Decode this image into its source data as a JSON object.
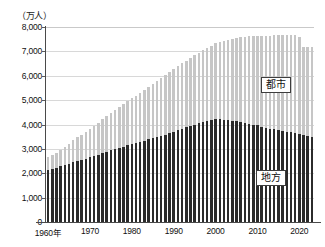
{
  "chart_data": {
    "type": "bar",
    "subtype": "stacked-bar",
    "title": "",
    "xlabel": "",
    "ylabel": "（万人）",
    "unit_label": "（万人）",
    "ylim": [
      0,
      8000
    ],
    "ytick_values": [
      8000,
      7000,
      6000,
      5000,
      4000,
      3000,
      2000,
      1000,
      0
    ],
    "ytick_labels": [
      "8,000",
      "7,000",
      "6,000",
      "5,000",
      "4,000",
      "3,000",
      "2,000",
      "1,000",
      "0"
    ],
    "grid": true,
    "grid_axis": "y",
    "legend_position": "inline-callout",
    "x_start": 1960,
    "x_end": 2023,
    "xtick_values": [
      1960,
      1970,
      1980,
      1990,
      2000,
      2010,
      2020
    ],
    "xtick_labels": [
      "1960年",
      "1970",
      "1980",
      "1990",
      "2000",
      "2010",
      "2020"
    ],
    "x": [
      1960,
      1961,
      1962,
      1963,
      1964,
      1965,
      1966,
      1967,
      1968,
      1969,
      1970,
      1971,
      1972,
      1973,
      1974,
      1975,
      1976,
      1977,
      1978,
      1979,
      1980,
      1981,
      1982,
      1983,
      1984,
      1985,
      1986,
      1987,
      1988,
      1989,
      1990,
      1991,
      1992,
      1993,
      1994,
      1995,
      1996,
      1997,
      1998,
      1999,
      2000,
      2001,
      2002,
      2003,
      2004,
      2005,
      2006,
      2007,
      2008,
      2009,
      2010,
      2011,
      2012,
      2013,
      2014,
      2015,
      2016,
      2017,
      2018,
      2019,
      2020,
      2021,
      2022,
      2023
    ],
    "series": [
      {
        "name": "地方",
        "label": "地方",
        "color": "#2b2b2b",
        "stack_order": 0,
        "values": [
          2150,
          2190,
          2230,
          2280,
          2330,
          2390,
          2450,
          2500,
          2550,
          2600,
          2650,
          2700,
          2760,
          2820,
          2880,
          2940,
          2990,
          3040,
          3090,
          3140,
          3190,
          3240,
          3290,
          3340,
          3390,
          3440,
          3490,
          3540,
          3590,
          3640,
          3700,
          3760,
          3820,
          3880,
          3940,
          4000,
          4050,
          4100,
          4140,
          4180,
          4230,
          4220,
          4200,
          4180,
          4160,
          4130,
          4100,
          4070,
          4040,
          4000,
          3960,
          3910,
          3870,
          3830,
          3800,
          3770,
          3740,
          3710,
          3680,
          3650,
          3620,
          3580,
          3540,
          3500
        ]
      },
      {
        "name": "都市",
        "label": "都市",
        "color": "#c6c6c6",
        "stack_order": 1,
        "values": [
          500,
          560,
          620,
          690,
          760,
          830,
          900,
          970,
          1040,
          1110,
          1180,
          1250,
          1320,
          1390,
          1460,
          1530,
          1600,
          1670,
          1740,
          1810,
          1880,
          1950,
          2020,
          2090,
          2160,
          2230,
          2300,
          2370,
          2440,
          2510,
          2570,
          2630,
          2690,
          2740,
          2790,
          2840,
          2900,
          2950,
          3000,
          3060,
          3110,
          3180,
          3240,
          3300,
          3360,
          3420,
          3480,
          3530,
          3580,
          3630,
          3680,
          3730,
          3780,
          3820,
          3860,
          3900,
          3940,
          3970,
          4000,
          4030,
          3980,
          3600,
          3660,
          3700
        ]
      }
    ],
    "totals": [
      2650,
      2750,
      2850,
      2970,
      3090,
      3220,
      3350,
      3470,
      3590,
      3710,
      3830,
      3950,
      4080,
      4210,
      4340,
      4470,
      4590,
      4710,
      4830,
      4950,
      5070,
      5190,
      5310,
      5430,
      5550,
      5670,
      5790,
      5910,
      6030,
      6150,
      6270,
      6390,
      6510,
      6620,
      6730,
      6840,
      6950,
      7050,
      7140,
      7240,
      7340,
      7400,
      7440,
      7480,
      7520,
      7550,
      7580,
      7600,
      7620,
      7630,
      7640,
      7640,
      7650,
      7650,
      7660,
      7670,
      7680,
      7680,
      7680,
      7680,
      7600,
      7180,
      7200,
      7200
    ]
  },
  "labels": {
    "urban": "都市",
    "rural": "地方"
  }
}
